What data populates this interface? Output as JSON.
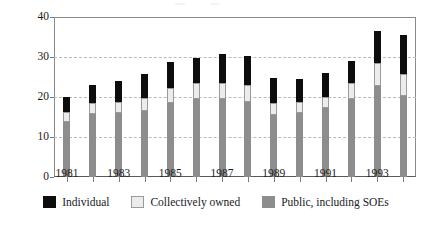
{
  "chart_data": {
    "type": "bar",
    "subtype": "stacked-bar",
    "title": "",
    "xlabel": "",
    "ylabel": "Percentage",
    "ylim": [
      0,
      40
    ],
    "yticks": [
      0,
      10,
      20,
      30,
      40
    ],
    "ytick_labels": [
      "0",
      "10",
      "20",
      "30",
      "40"
    ],
    "grid": "horizontal-dashed",
    "legend_position": "bottom-center",
    "categories": [
      1981,
      1982,
      1983,
      1984,
      1985,
      1986,
      1987,
      1988,
      1989,
      1990,
      1991,
      1992,
      1993,
      1994
    ],
    "xtick_labels": [
      "1981",
      "1983",
      "1985",
      "1987",
      "1989",
      "1991",
      "1993"
    ],
    "xtick_values": [
      1981,
      1983,
      1985,
      1987,
      1989,
      1991,
      1993
    ],
    "series": [
      {
        "name": "Public, including SOEs",
        "color": "#8d8d8d",
        "values": [
          13.7,
          15.7,
          16.0,
          16.4,
          18.5,
          19.5,
          19.5,
          18.7,
          15.4,
          15.9,
          17.2,
          19.4,
          22.7,
          20.2
        ]
      },
      {
        "name": "Collectively owned",
        "color": "#ececec",
        "values": [
          2.5,
          2.8,
          2.7,
          3.3,
          3.8,
          3.9,
          3.9,
          4.3,
          3.2,
          2.8,
          2.8,
          4.2,
          5.8,
          5.6
        ]
      },
      {
        "name": "Individual",
        "color": "#0d0d0d",
        "values": [
          3.8,
          4.5,
          5.3,
          6.1,
          6.4,
          6.4,
          7.4,
          7.3,
          6.2,
          5.7,
          5.9,
          5.3,
          8.0,
          9.8
        ]
      }
    ],
    "totals": [
      20.0,
      23.0,
      24.0,
      25.8,
      28.7,
      29.8,
      30.8,
      30.3,
      24.8,
      24.4,
      25.9,
      28.9,
      36.5,
      35.6
    ]
  },
  "legend": {
    "items": [
      {
        "label": "Individual",
        "swatch": "individual-swatch"
      },
      {
        "label": "Collectively owned",
        "swatch": "collective-swatch"
      },
      {
        "label": "Public, including SOEs",
        "swatch": "public-swatch"
      }
    ]
  }
}
